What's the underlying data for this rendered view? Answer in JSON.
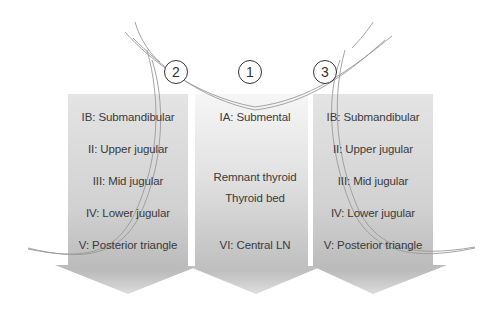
{
  "diagram": {
    "type": "neck-dissection-compartments",
    "colors": {
      "arrow_top": "#e6e6e6",
      "arrow_bottom": "#b4b4b4",
      "middle_top": "#f4f4f4",
      "incision_line": "#9a9a9a",
      "text": "#3a3a3a",
      "circle_border": "#333333"
    },
    "markers": [
      {
        "id": "2",
        "label": "2"
      },
      {
        "id": "1",
        "label": "1"
      },
      {
        "id": "3",
        "label": "3"
      }
    ],
    "columns": [
      {
        "name": "left-lateral",
        "marker": "2",
        "labels": [
          "IB: Submandibular",
          "II: Upper jugular",
          "III: Mid jugular",
          "IV: Lower jugular",
          "V: Posterior triangle"
        ]
      },
      {
        "name": "central",
        "marker": "1",
        "labels": [
          "IA: Submental",
          "Remnant thyroid",
          "Thyroid bed",
          "VI: Central LN"
        ]
      },
      {
        "name": "right-lateral",
        "marker": "3",
        "labels": [
          "IB: Submandibular",
          "II: Upper jugular",
          "III: Mid jugular",
          "IV: Lower jugular",
          "V: Posterior triangle"
        ]
      }
    ]
  }
}
